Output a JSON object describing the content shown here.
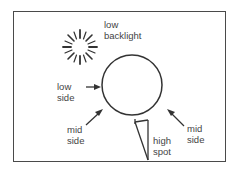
{
  "diagram": {
    "labels": {
      "backlight": [
        "low",
        "backlight"
      ],
      "low_side": [
        "low",
        "side"
      ],
      "mid_side_left": [
        "mid",
        "side"
      ],
      "mid_side_right": [
        "mid",
        "side"
      ],
      "high_spot": [
        "high",
        "spot"
      ]
    },
    "colors": {
      "stroke": "#333333",
      "text": "#444444",
      "background": "#ffffff"
    }
  }
}
